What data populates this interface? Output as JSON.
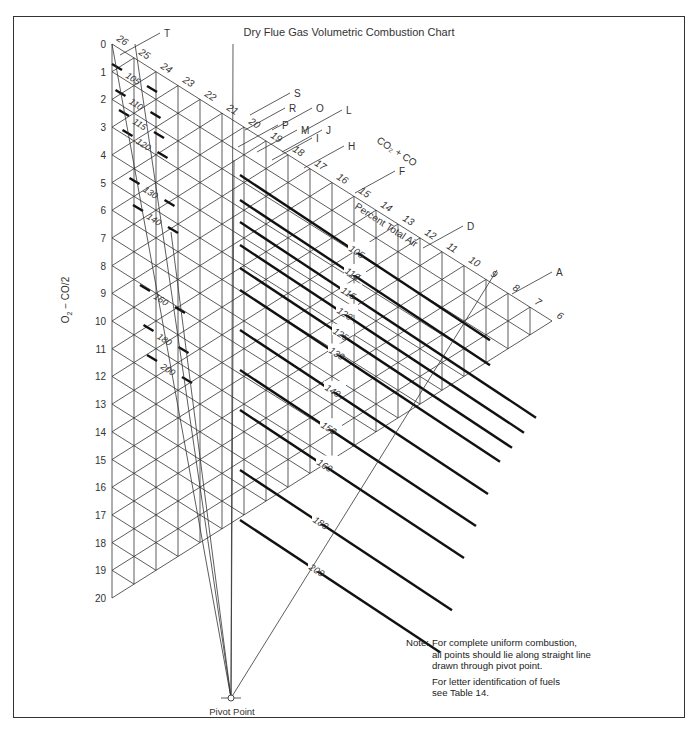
{
  "chart_data": {
    "type": "nomogram",
    "title": "Dry Flue Gas Volumetric Combustion Chart",
    "ylabel": "O2 − CO/2",
    "xlabel": "CO2 + CO",
    "diagonal_label": "Percent Total Air",
    "o2_axis_ticks": [
      0,
      1,
      2,
      3,
      4,
      5,
      6,
      7,
      8,
      9,
      10,
      11,
      12,
      13,
      14,
      15,
      16,
      17,
      18,
      19,
      20
    ],
    "co2_axis_ticks": [
      26,
      25,
      24,
      23,
      22,
      21,
      20,
      19,
      18,
      17,
      16,
      15,
      14,
      13,
      12,
      11,
      10,
      9,
      8,
      7,
      6
    ],
    "percent_total_air_lines": [
      105,
      110,
      115,
      120,
      125,
      130,
      140,
      150,
      160,
      180,
      200
    ],
    "fuel_letters": [
      "T",
      "S",
      "R",
      "O",
      "P",
      "L",
      "M",
      "I",
      "J",
      "H",
      "F",
      "D",
      "A"
    ],
    "pivot_point": "Pivot Point",
    "grid": "triangular",
    "legend": "none"
  },
  "header": {
    "title": "Dry Flue Gas Volumetric Combustion Chart"
  },
  "axes": {
    "ylabel_main": "O",
    "ylabel_sub": "2",
    "ylabel_rest": " − CO/2",
    "xlabel": "CO₂ + CO",
    "diagonal": "Percent Total Air"
  },
  "pivot": {
    "label": "Pivot Point"
  },
  "note": {
    "label": "Note:",
    "lines": [
      "For complete uniform combustion,",
      "all points should lie along straight line",
      "drawn through pivot point."
    ],
    "lines2": [
      "For letter identification of fuels",
      "see Table 14."
    ]
  }
}
